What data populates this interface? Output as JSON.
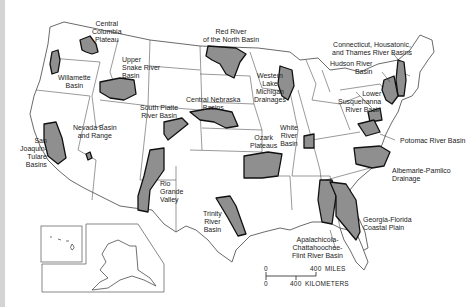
{
  "map": {
    "subject": "Study units of the United States",
    "colors": {
      "basin_fill": "#8f8f8f",
      "basin_outline": "#111111",
      "boundary": "#555555",
      "background": "#ffffff"
    },
    "basins": [
      {
        "id": "central-columbia",
        "label": "Central\nColumbia\nPlateau"
      },
      {
        "id": "willamette",
        "label": "Willamette\nBasin"
      },
      {
        "id": "upper-snake",
        "label": "Upper\nSnake River\nBasin"
      },
      {
        "id": "red-river",
        "label": "Red River\nof the North Basin"
      },
      {
        "id": "central-nebraska",
        "label": "Central Nebraska\nBasins"
      },
      {
        "id": "south-platte",
        "label": "South Platte\nRiver Basin"
      },
      {
        "id": "nevada",
        "label": "Nevada Basin\nand Range"
      },
      {
        "id": "san-joaquin",
        "label": "San\nJoaquin-\nTulare\nBasins"
      },
      {
        "id": "rio-grande",
        "label": "Rio\nGrande\nValley"
      },
      {
        "id": "western-lake-michigan",
        "label": "Western\nLake\nMichigan\nDrainages"
      },
      {
        "id": "ozark",
        "label": "Ozark\nPlateaus"
      },
      {
        "id": "white-river",
        "label": "White\nRiver\nBasin"
      },
      {
        "id": "trinity",
        "label": "Trinity\nRiver\nBasin"
      },
      {
        "id": "connecticut",
        "label": "Connecticut, Housatonic,\nand Thames River Basins"
      },
      {
        "id": "hudson",
        "label": "Hudson River\nBasin"
      },
      {
        "id": "lower-susquehanna",
        "label": "Lower\nSusquehanna\nRiver Basin"
      },
      {
        "id": "potomac",
        "label": "Potomac River Basin"
      },
      {
        "id": "albemarle",
        "label": "Albemarle-Pamlico\nDrainage"
      },
      {
        "id": "georgia-florida",
        "label": "Georgia-Florida\nCoastal Plain"
      },
      {
        "id": "apalachicola",
        "label": "Apalachicola-\nChattahoochee-\nFlint River Basin"
      }
    ],
    "insets": [
      "Hawaii",
      "Alaska"
    ],
    "scale": {
      "miles_zero": "0",
      "miles_value": "400",
      "miles_unit": "MILES",
      "km_zero": "0",
      "km_value": "400",
      "km_unit": "KILOMETERS"
    }
  }
}
